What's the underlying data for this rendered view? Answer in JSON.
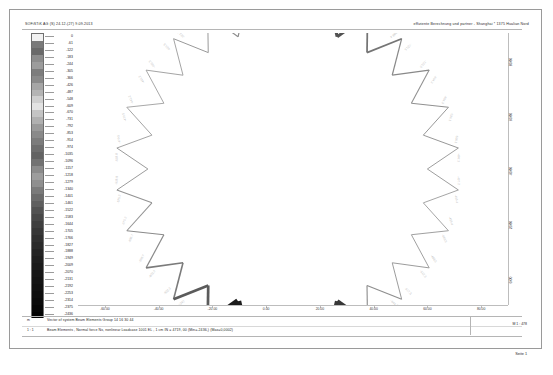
{
  "header": {
    "left": "SOFiSTiK AG (S) 24.12-(27)  9.09.2013",
    "right": "effiziente Berechnung und partner - Shanghai * 1375 Hualian Nord"
  },
  "legend": {
    "title": "Nx [kN]",
    "unit": "kN",
    "min": -2436,
    "max": 0,
    "step": -61,
    "values": [
      0,
      -61,
      -122,
      -183,
      -244,
      -305,
      -366,
      -426,
      -487,
      -548,
      -609,
      -670,
      -731,
      -792,
      -853,
      -914,
      -974,
      -1035,
      -1096,
      -1157,
      -1218,
      -1279,
      -1340,
      -1401,
      -1461,
      -1522,
      -1583,
      -1644,
      -1705,
      -1766,
      -1827,
      -1888,
      -1949,
      -2009,
      -2070,
      -2131,
      -2192,
      -2253,
      -2314,
      -2375,
      -2436
    ],
    "swatch_colors": [
      "#f2f2f2",
      "#7a7a7a",
      "#6a6a6a",
      "#8d8d8d",
      "#9c9c9c",
      "#7d7d7d",
      "#8a8a8a",
      "#a6a6a6",
      "#b4b4b4",
      "#cfcfcf",
      "#e2e2e2",
      "#c4c4c4",
      "#b0b0b0",
      "#9a9a9a",
      "#8a8a8a",
      "#7c7c7c",
      "#6e6e6e",
      "#636363",
      "#727272",
      "#8b8b8b",
      "#9d9d9d",
      "#8f8f8f",
      "#7b7b7b",
      "#6c6c6c",
      "#5f5f5f",
      "#525252",
      "#484848",
      "#3f3f3f",
      "#373737",
      "#303030",
      "#2a2a2a",
      "#242424",
      "#1f1f1f",
      "#1b1b1b",
      "#171717",
      "#141414",
      "#111111",
      "#0e0e0e",
      "#0b0b0b",
      "#070707",
      "#030303"
    ]
  },
  "axes": {
    "xlabel": "",
    "ylabel": "",
    "xticks": [
      {
        "value": -60.0,
        "label": "-60.00"
      },
      {
        "value": -40.0,
        "label": "-40.00"
      },
      {
        "value": -20.0,
        "label": "-20.00"
      },
      {
        "value": 0.0,
        "label": "0.00"
      },
      {
        "value": 20.0,
        "label": "20.00"
      },
      {
        "value": 40.0,
        "label": "40.00"
      },
      {
        "value": 60.0,
        "label": "60.00"
      },
      {
        "value": 80.0,
        "label": "80.00"
      }
    ],
    "yticks": [
      {
        "value": 80.0,
        "label": "80.00"
      },
      {
        "value": 60.0,
        "label": "60.00"
      },
      {
        "value": 40.0,
        "label": "40.00"
      },
      {
        "value": 20.0,
        "label": "20.00"
      },
      {
        "value": 0.0,
        "label": "0.00"
      }
    ]
  },
  "footer": {
    "marker1": "m",
    "line1": "Vector of system Beam Elements Group 14 16 30 44",
    "marker2": "1 : 1",
    "line2": "Beam Elements , Normal force Nx, nonlinear Loadcase 1001 EL  ,  1 cm IN = 4719,  00 (Min=-2436,)  (Max=0,0002)",
    "right": "M 1 : 478",
    "page": "Seite 1"
  },
  "chart_data": {
    "type": "scatter",
    "title": "Beam Elements , Normal force Nx, nonlinear Loadcase 1001",
    "subtitle": "Vector of system Beam Elements Group 14 16 30 44",
    "xlabel": "",
    "ylabel": "",
    "xlim": [
      -70,
      90
    ],
    "ylim": [
      -10,
      90
    ],
    "grid": false,
    "legend_position": "left",
    "colorbar": {
      "label": "Nx [kN]",
      "min": -2436,
      "max": 0,
      "step": 61,
      "colormap": "grayscale-discrete-41"
    },
    "geometry": {
      "description": "Closed circular zig-zag (star) truss ring of beam elements; alternating inner and outer nodes connected by diagonal members. Member line thickness and grey value encode the magnitude of the axial normal force Nx.",
      "shape": "star-polygon-ring",
      "segments": 26,
      "outer_radius": 64.0,
      "inner_radius": 52.0,
      "center_x": 8.0,
      "center_y": 40.0
    },
    "series": [
      {
        "name": "Normal force Nx per beam element",
        "unit": "kN",
        "values": [
          -2436,
          -1827,
          -644.2,
          -512.3,
          -488.5,
          -455.4,
          -497.2,
          -536.1,
          -604.3,
          -721.5,
          -988.4,
          -1461,
          -2314,
          -1949,
          -667.1,
          -522.4,
          -465.3,
          -441.2,
          -470.5,
          -518.8,
          -575.2,
          -698.7,
          -902.3,
          -1340,
          -2192,
          -1705
        ]
      }
    ],
    "annotations": [
      {
        "text": "-2436",
        "note": "largest compression, heavy black member, lower-left sector"
      },
      {
        "text": "-2314",
        "note": "heavy black member, left sector"
      },
      {
        "text": "-2192",
        "note": "heavy black member, right sector"
      },
      {
        "text": "-1949",
        "note": "dark member, mid-left"
      },
      {
        "text": "-1827",
        "note": "dark member, upper-left"
      },
      {
        "text": "-1705",
        "note": "dark member, right sector"
      }
    ]
  }
}
